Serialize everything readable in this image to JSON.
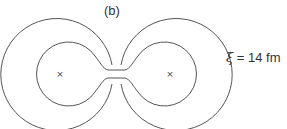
{
  "figure": {
    "panel_label": "(b)",
    "annotation": {
      "symbol": "ξ",
      "equals": " = ",
      "value": "14 fm"
    },
    "markers": [
      {
        "label": "×",
        "x": 60,
        "y": 74
      },
      {
        "label": "×",
        "x": 170,
        "y": 74
      }
    ],
    "stroke_color": "#555555",
    "background_color": "#ffffff"
  }
}
